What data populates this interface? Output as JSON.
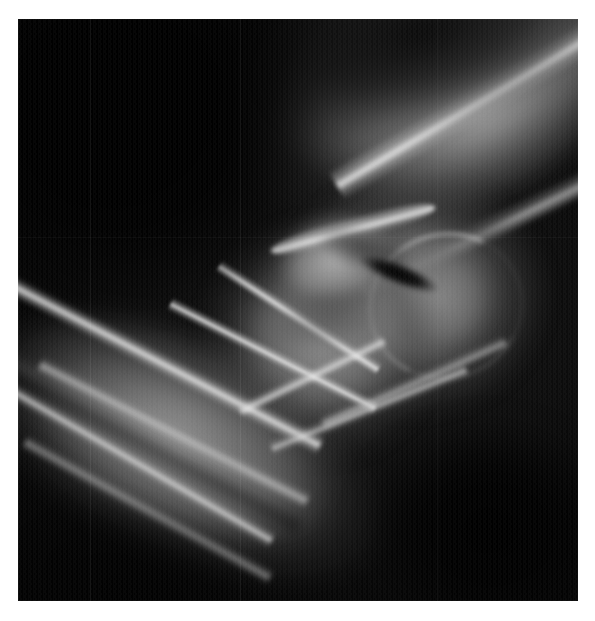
{
  "document": {
    "kind": "radiograph",
    "page_background": "#ffffff",
    "caption": ""
  },
  "image": {
    "modality": "X-ray",
    "body_part": "elbow",
    "projection": "lateral",
    "background_color": "#000000",
    "frame": {
      "x": 18,
      "y": 19,
      "width": 560,
      "height": 582
    },
    "alt_text": "Lateral radiograph of an elbow joint",
    "palette": {
      "black": "#000000",
      "soft_tissue_dark": "#2a2a2a",
      "soft_tissue_mid": "#6e6e6e",
      "bone_medullary": "#9a9a9a",
      "bone_cortex": "#e8e8e8",
      "bone_cortex_bright": "#fafafa",
      "page_white": "#ffffff"
    },
    "regions": [
      {
        "name": "humerus-shaft",
        "label": "Humeral shaft",
        "position": "upper-right",
        "orientation_deg": -29,
        "brightness": "mid-grey"
      },
      {
        "name": "humerus-cortex-superior",
        "label": "Superior humeral cortex",
        "position": "top-right sweeping edge",
        "brightness": "bright"
      },
      {
        "name": "distal-humerus-condyles",
        "label": "Distal humerus / condyles",
        "position": "centre-right",
        "brightness": "mid-grey"
      },
      {
        "name": "capitellum",
        "label": "Capitellum",
        "position": "centre-right rounded",
        "brightness": "mid-grey with bright rim"
      },
      {
        "name": "olecranon",
        "label": "Olecranon process",
        "position": "upper-centre beak",
        "brightness": "bright"
      },
      {
        "name": "olecranon-fossa",
        "label": "Olecranon fossa",
        "position": "upper centre-right slot",
        "brightness": "near-black"
      },
      {
        "name": "trochlear-notch",
        "label": "Trochlear notch",
        "position": "centre",
        "brightness": "dark"
      },
      {
        "name": "coronoid-process",
        "label": "Coronoid process",
        "position": "centre below joint",
        "brightness": "bright ridge"
      },
      {
        "name": "joint-space",
        "label": "Humeroulnar joint line",
        "position": "centre crossing lines",
        "brightness": "bright"
      },
      {
        "name": "ulna-shaft",
        "label": "Ulnar shaft",
        "position": "lower-left diagonal",
        "orientation_deg": 27,
        "brightness": "bright cortical streak"
      },
      {
        "name": "radius-shaft",
        "label": "Radial shaft",
        "position": "lower-left diagonal, parallel",
        "orientation_deg": 29,
        "brightness": "bright cortical streak"
      },
      {
        "name": "posterior-soft-tissue",
        "label": "Posterior soft tissue / background",
        "position": "lower-right",
        "brightness": "black"
      },
      {
        "name": "anterior-background",
        "label": "Background",
        "position": "upper-left",
        "brightness": "black"
      }
    ],
    "artifacts": [
      {
        "name": "scanline-1",
        "type": "vertical-scan-line",
        "x": 90
      },
      {
        "name": "scanline-2",
        "type": "vertical-scan-line",
        "x": 240
      },
      {
        "name": "scanline-3",
        "type": "vertical-scan-line",
        "x": 437
      },
      {
        "name": "film-grain",
        "type": "grain",
        "intensity": "moderate"
      }
    ]
  }
}
